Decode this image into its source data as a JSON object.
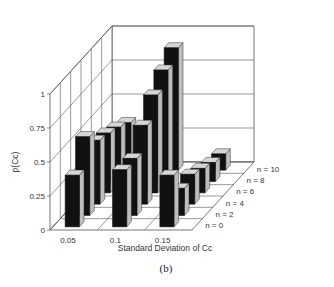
{
  "chart_data": {
    "type": "bar3d",
    "title": "",
    "caption": "(b)",
    "xlabel": "Standard Deviation of Cc",
    "ylabel": "p(Cc)",
    "zlabel": "",
    "categories": [
      "0.05",
      "0.1",
      "0.15"
    ],
    "depth_categories": [
      "n = 0",
      "n = 2",
      "n = 4",
      "n = 6",
      "n = 8",
      "n = 10"
    ],
    "yticks": [
      "0",
      "0.25",
      "0.5",
      "0.75",
      "1"
    ],
    "ylim": [
      0,
      1
    ],
    "grid": true,
    "series": [
      {
        "name": "n = 0",
        "values": [
          0.38,
          0.42,
          0.38
        ]
      },
      {
        "name": "n = 2",
        "values": [
          0.58,
          0.42,
          0.2
        ]
      },
      {
        "name": "n = 4",
        "values": [
          0.47,
          0.58,
          0.22
        ]
      },
      {
        "name": "n = 6",
        "values": [
          0.44,
          0.72,
          0.18
        ]
      },
      {
        "name": "n = 8",
        "values": [
          0.4,
          0.82,
          0.14
        ]
      },
      {
        "name": "n = 10",
        "values": [
          0.35,
          0.9,
          0.12
        ]
      }
    ],
    "colors": {
      "front": "#111111",
      "side": "#bdbdbd",
      "top": "#d6d6d6",
      "grid": "#555555"
    }
  }
}
